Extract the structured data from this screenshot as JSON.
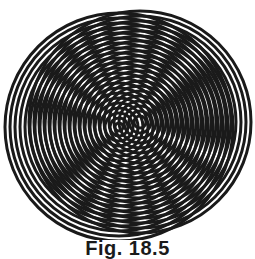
{
  "figure": {
    "stroke_color": "#1a1a1a",
    "background": "#ffffff",
    "circle_sets": [
      {
        "name": "left-set",
        "cx": 119,
        "cy": 127,
        "max_r": 114,
        "spacing": 5,
        "stroke_width": 3
      },
      {
        "name": "right-set",
        "cx": 140,
        "cy": 122,
        "max_r": 111,
        "spacing": 5,
        "stroke_width": 3
      }
    ]
  },
  "caption": {
    "text": "Fig. 18.5"
  }
}
